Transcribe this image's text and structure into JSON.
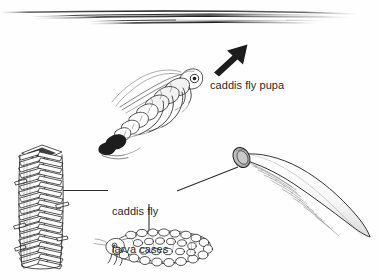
{
  "figure": {
    "background_color": "#fefefe",
    "ink_color": "#1d1d1d",
    "text_color": "#2b2b2b",
    "width": 380,
    "height": 279
  },
  "labels": {
    "pupa": "caddis fly pupa",
    "cases_line1": "caddis fly",
    "cases_line2": "larva cases"
  },
  "elements": {
    "water_surface": "water-surface-lines",
    "arrow": "emergence-arrow",
    "pupa": "caddis-fly-pupa-drawing",
    "stick_case": "stick-larva-case-drawing",
    "cone_case": "tapered-sand-larva-case-drawing",
    "gravel_larva": "gravel-cased-larva-drawing"
  },
  "leaders": {
    "stick_case": "leader-line-stick-case",
    "cone_case": "leader-line-cone-case",
    "gravel_larva": "leader-line-gravel-larva"
  }
}
